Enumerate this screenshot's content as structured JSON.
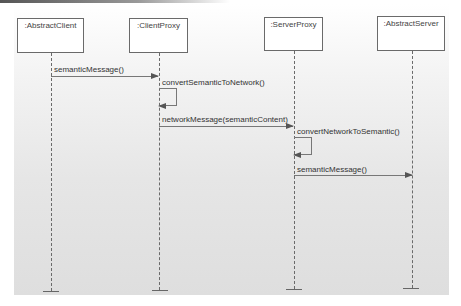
{
  "diagram": {
    "type": "sequence",
    "participants": [
      {
        "name": ":AbstractClient"
      },
      {
        "name": ":ClientProxy"
      },
      {
        "name": ":ServerProxy"
      },
      {
        "name": ":AbstractServer"
      }
    ],
    "messages": [
      {
        "from": ":AbstractClient",
        "to": ":ClientProxy",
        "label": "semanticMessage()"
      },
      {
        "from": ":ClientProxy",
        "to": ":ClientProxy",
        "label": "convertSemanticToNetwork()"
      },
      {
        "from": ":ClientProxy",
        "to": ":ServerProxy",
        "label": "networkMessage(semanticContent)"
      },
      {
        "from": ":ServerProxy",
        "to": ":ServerProxy",
        "label": "convertNetworkToSemantic()"
      },
      {
        "from": ":ServerProxy",
        "to": ":AbstractServer",
        "label": "semanticMessage()"
      }
    ]
  }
}
